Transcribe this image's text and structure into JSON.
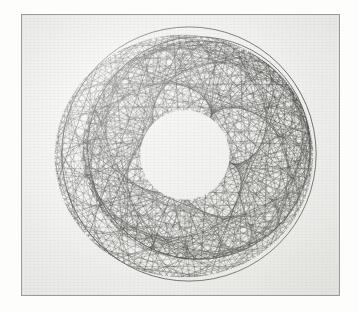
{
  "page": {
    "background_color": "#fdfdfc",
    "width": 359,
    "height": 312
  },
  "plate": {
    "name": "geometric chord envelope figure",
    "frame_color": "#9a9a99",
    "frame_x": 21,
    "frame_y": 14,
    "frame_width": 319,
    "frame_height": 282,
    "paper_color": "#f3f3f1",
    "ink_color": "#2b2b2b",
    "caption": ""
  },
  "chart_data": {
    "type": "line",
    "title": "",
    "subtitle": "",
    "xlabel": "",
    "ylabel": "",
    "grid": false,
    "legend_position": "none",
    "xlim": [
      0,
      319
    ],
    "ylim": [
      0,
      282
    ],
    "render": {
      "stroke_color": "#2f2f2d",
      "stroke_width": 0.42,
      "stroke_opacity": 0.78,
      "hole_fill": "#f4f4f2"
    },
    "series": [
      {
        "name": "outer chord family",
        "kind": "chord-envelope",
        "center_x": 163,
        "center_y": 142,
        "radius": 131,
        "points": 300,
        "step": 107,
        "turns": 1,
        "rotation_deg": 198,
        "squash_x": 0.99,
        "squash_y": 0.93,
        "opacity": 0.62
      },
      {
        "name": "inner chord family",
        "kind": "chord-envelope",
        "center_x": 176,
        "center_y": 136,
        "radius": 116,
        "points": 300,
        "step": 113,
        "turns": 1,
        "rotation_deg": 22,
        "squash_x": 0.99,
        "squash_y": 0.95,
        "opacity": 0.66
      }
    ],
    "envelopes": [
      {
        "name": "outer dark caustic ring",
        "center_x": 168,
        "center_y": 140,
        "radius": 128,
        "stroke": "#3a3a37"
      },
      {
        "name": "middle dark caustic ring",
        "center_x": 178,
        "center_y": 134,
        "radius": 112,
        "stroke": "#3a3a37"
      },
      {
        "name": "central clear hole",
        "center_x": 164,
        "center_y": 141,
        "radius": 45,
        "fill": "#f4f4f2"
      }
    ],
    "annotations": []
  }
}
